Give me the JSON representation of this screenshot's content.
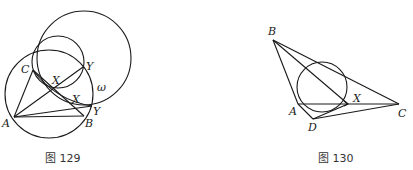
{
  "figures": [
    {
      "id": "fig129",
      "caption": "图 129",
      "labels": {
        "A": "A",
        "B": "B",
        "C": "C",
        "X_upper": "X",
        "Y_upper": "Y",
        "X_lower": "X",
        "Y_lower": "Y",
        "omega": "ω"
      }
    },
    {
      "id": "fig130",
      "caption": "图 130",
      "labels": {
        "A": "A",
        "B": "B",
        "C": "C",
        "D": "D",
        "X": "X"
      }
    }
  ],
  "colors": {
    "stroke": "#1a1a1a",
    "background": "#ffffff"
  }
}
